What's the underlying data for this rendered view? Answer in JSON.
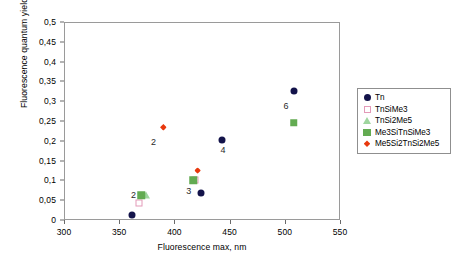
{
  "chart_data": {
    "type": "scatter",
    "title": "",
    "xlabel": "Fluorescence max, nm",
    "ylabel": "Fluorescence quantum yield",
    "xlim": [
      300,
      550
    ],
    "ylim": [
      0,
      0.5
    ],
    "xticks": [
      "300",
      "350",
      "400",
      "450",
      "500",
      "550"
    ],
    "xtick_values": [
      300,
      350,
      400,
      450,
      500,
      550
    ],
    "yticks": [
      "0",
      "0,05",
      "0,1",
      "0,15",
      "0,2",
      "0,25",
      "0,3",
      "0,35",
      "0,4",
      "0,45",
      "0,5"
    ],
    "ytick_values": [
      0,
      0.05,
      0.1,
      0.15,
      0.2,
      0.25,
      0.3,
      0.35,
      0.4,
      0.45,
      0.5
    ],
    "decimal_separator": ",",
    "grid": false,
    "legend_position": "right",
    "series": [
      {
        "name": "Tn",
        "marker": "filled-circle",
        "color": "#13134a",
        "points": [
          {
            "x": 362,
            "y": 0.013
          },
          {
            "x": 424,
            "y": 0.067
          },
          {
            "x": 443,
            "y": 0.201
          },
          {
            "x": 508,
            "y": 0.325
          }
        ]
      },
      {
        "name": "TnSiMe3",
        "marker": "open-square",
        "color": "#e39ab8",
        "points": [
          {
            "x": 368,
            "y": 0.043
          },
          {
            "x": 419,
            "y": 0.1
          }
        ]
      },
      {
        "name": "TnSi2Me5",
        "marker": "open-triangle",
        "color": "#9fd69f",
        "points": [
          {
            "x": 374,
            "y": 0.063
          }
        ]
      },
      {
        "name": "Me3SiTnSiMe3",
        "marker": "filled-square",
        "color": "#63ab52",
        "points": [
          {
            "x": 370,
            "y": 0.062
          },
          {
            "x": 417,
            "y": 0.101
          },
          {
            "x": 508,
            "y": 0.246
          }
        ]
      },
      {
        "name": "Me5Si2TnSi2Me5",
        "marker": "filled-diamond",
        "color": "#e8380d",
        "points": [
          {
            "x": 390,
            "y": 0.234
          },
          {
            "x": 421,
            "y": 0.125
          }
        ]
      }
    ],
    "annotations": [
      {
        "text": "2",
        "x": 363,
        "y": 0.064
      },
      {
        "text": "2",
        "x": 381,
        "y": 0.196
      },
      {
        "text": "3",
        "x": 413,
        "y": 0.074
      },
      {
        "text": "4",
        "x": 444,
        "y": 0.177
      },
      {
        "text": "6",
        "x": 501,
        "y": 0.287
      }
    ]
  }
}
